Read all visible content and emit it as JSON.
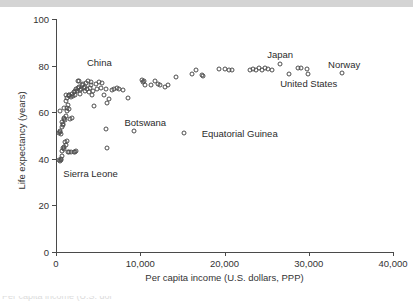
{
  "figure": {
    "top_band_present": true,
    "bottom_caption_ghost": "Per capita income (U.S. dol"
  },
  "chart_data": {
    "type": "scatter",
    "title": "",
    "xlabel": "Per capita income (U.S. dollars, PPP)",
    "ylabel": "Life expectancy (years)",
    "xlim": [
      0,
      40000
    ],
    "ylim": [
      0,
      100
    ],
    "xticks": [
      0,
      10000,
      20000,
      30000,
      40000
    ],
    "xticklabels": [
      "0",
      "10,000",
      "20,000",
      "30,000",
      "40,000"
    ],
    "yticks": [
      0,
      20,
      40,
      60,
      80,
      100
    ],
    "yticklabels": [
      "0",
      "20",
      "40",
      "60",
      "80",
      "100"
    ],
    "grid": false,
    "legend": false,
    "marker": "open-circle",
    "marker_color": "#4d4d4d",
    "points": [
      [
        400,
        39.5
      ],
      [
        500,
        39.0
      ],
      [
        560,
        40.0
      ],
      [
        620,
        39.5
      ],
      [
        700,
        41.0
      ],
      [
        760,
        43.5
      ],
      [
        820,
        44.5
      ],
      [
        900,
        45.0
      ],
      [
        980,
        44.0
      ],
      [
        1050,
        47.0
      ],
      [
        1150,
        46.0
      ],
      [
        1250,
        47.5
      ],
      [
        1400,
        43.0
      ],
      [
        1600,
        43.0
      ],
      [
        1750,
        43.0
      ],
      [
        2100,
        43.0
      ],
      [
        2250,
        43.0
      ],
      [
        2400,
        43.2
      ],
      [
        380,
        51.0
      ],
      [
        450,
        51.5
      ],
      [
        520,
        52.0
      ],
      [
        600,
        50.5
      ],
      [
        660,
        53.5
      ],
      [
        700,
        56.0
      ],
      [
        780,
        55.0
      ],
      [
        850,
        54.5
      ],
      [
        920,
        57.0
      ],
      [
        1000,
        57.5
      ],
      [
        1080,
        56.5
      ],
      [
        1150,
        58.5
      ],
      [
        1250,
        60.5
      ],
      [
        1350,
        62.0
      ],
      [
        1450,
        63.0
      ],
      [
        1550,
        61.5
      ],
      [
        1700,
        57.0
      ],
      [
        1850,
        57.5
      ],
      [
        420,
        60.5
      ],
      [
        900,
        62.0
      ],
      [
        1150,
        65.0
      ],
      [
        1300,
        66.0
      ],
      [
        1500,
        67.0
      ],
      [
        1600,
        67.5
      ],
      [
        1750,
        66.5
      ],
      [
        1900,
        68.0
      ],
      [
        2000,
        67.0
      ],
      [
        2100,
        68.5
      ],
      [
        2200,
        69.0
      ],
      [
        2300,
        67.5
      ],
      [
        2400,
        70.0
      ],
      [
        2500,
        69.0
      ],
      [
        2600,
        70.5
      ],
      [
        2700,
        71.0
      ],
      [
        2750,
        73.5
      ],
      [
        2800,
        68.0
      ],
      [
        2900,
        69.5
      ],
      [
        3000,
        70.0
      ],
      [
        3100,
        71.5
      ],
      [
        3200,
        72.0
      ],
      [
        3300,
        70.5
      ],
      [
        3400,
        69.0
      ],
      [
        3500,
        71.0
      ],
      [
        3600,
        72.5
      ],
      [
        3700,
        70.0
      ],
      [
        3800,
        73.5
      ],
      [
        3900,
        68.5
      ],
      [
        4000,
        70.5
      ],
      [
        4100,
        73.0
      ],
      [
        4200,
        71.5
      ],
      [
        4300,
        67.5
      ],
      [
        4400,
        69.0
      ],
      [
        4500,
        62.5
      ],
      [
        4700,
        72.0
      ],
      [
        4900,
        70.0
      ],
      [
        5100,
        73.0
      ],
      [
        5300,
        70.5
      ],
      [
        5500,
        72.5
      ],
      [
        5700,
        67.5
      ],
      [
        5900,
        70.0
      ],
      [
        6100,
        64.0
      ],
      [
        6300,
        65.5
      ],
      [
        6600,
        69.5
      ],
      [
        6900,
        70.0
      ],
      [
        7200,
        70.5
      ],
      [
        7500,
        70.0
      ],
      [
        8000,
        69.5
      ],
      [
        1500,
        67.5
      ],
      [
        1200,
        67.5
      ],
      [
        2600,
        73.5
      ],
      [
        5900,
        53.0
      ],
      [
        6100,
        44.5
      ],
      [
        8600,
        66.0
      ],
      [
        9200,
        52.0
      ],
      [
        10200,
        74.0
      ],
      [
        10350,
        73.0
      ],
      [
        10500,
        73.5
      ],
      [
        10600,
        71.5
      ],
      [
        11300,
        71.5
      ],
      [
        11800,
        73.5
      ],
      [
        12100,
        72.0
      ],
      [
        12400,
        71.5
      ],
      [
        12900,
        71.0
      ],
      [
        13300,
        71.5
      ],
      [
        14200,
        75.0
      ],
      [
        15200,
        51.0
      ],
      [
        16100,
        76.5
      ],
      [
        16600,
        78.0
      ],
      [
        17300,
        76.0
      ],
      [
        17500,
        75.5
      ],
      [
        19400,
        78.5
      ],
      [
        20100,
        78.5
      ],
      [
        20500,
        78.0
      ],
      [
        20900,
        78.0
      ],
      [
        23000,
        78.0
      ],
      [
        23400,
        78.5
      ],
      [
        23700,
        78.0
      ],
      [
        24100,
        79.0
      ],
      [
        24400,
        78.0
      ],
      [
        24800,
        79.0
      ],
      [
        25200,
        78.5
      ],
      [
        25600,
        78.0
      ],
      [
        26600,
        80.5
      ],
      [
        27600,
        76.5
      ],
      [
        28700,
        79.0
      ],
      [
        29100,
        79.0
      ],
      [
        29800,
        78.5
      ],
      [
        29900,
        76.5
      ],
      [
        34000,
        77.0
      ]
    ],
    "annotations": [
      {
        "label": "China",
        "x": 5150,
        "y": 81.5,
        "anchor": "center"
      },
      {
        "label": "Japan",
        "x": 26600,
        "y": 85.0,
        "anchor": "center"
      },
      {
        "label": "Norway",
        "x": 34200,
        "y": 80.5,
        "anchor": "center"
      },
      {
        "label": "United States",
        "x": 30000,
        "y": 72.5,
        "anchor": "center"
      },
      {
        "label": "Botswana",
        "x": 10600,
        "y": 56.0,
        "anchor": "center"
      },
      {
        "label": "Equatorial Guinea",
        "x": 21800,
        "y": 51.0,
        "anchor": "center"
      },
      {
        "label": "Sierra Leone",
        "x": 4100,
        "y": 34.0,
        "anchor": "center"
      }
    ]
  }
}
